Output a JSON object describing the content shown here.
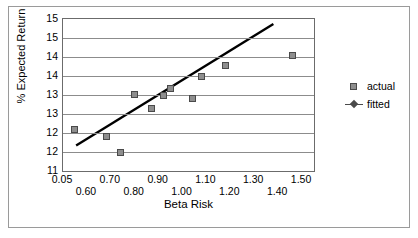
{
  "chart_data": {
    "type": "scatter",
    "title": "",
    "xlabel": "Beta Risk",
    "ylabel": "% Expected Return",
    "xlim": [
      0.5,
      1.55
    ],
    "ylim": [
      11.0,
      15.0
    ],
    "grid": "horizontal",
    "legend_position": "right",
    "x_tick_labels": [
      "0.05",
      "0.60",
      "0.70",
      "0.80",
      "0.90",
      "1.00",
      "1.10",
      "1.20",
      "1.30",
      "1.40",
      "1.50"
    ],
    "x_tick_values": [
      0.5,
      0.6,
      0.7,
      0.8,
      0.9,
      1.0,
      1.1,
      1.2,
      1.3,
      1.4,
      1.5
    ],
    "y_tick_labels": [
      "15",
      "15",
      "14",
      "14",
      "13",
      "13",
      "12",
      "12",
      "11"
    ],
    "y_tick_values": [
      15.0,
      14.5,
      14.0,
      13.5,
      13.0,
      12.5,
      12.0,
      11.5,
      11.0
    ],
    "series": [
      {
        "name": "actual",
        "type": "scatter",
        "marker": "square",
        "color": "#8e8e8e",
        "points": [
          {
            "x": 0.55,
            "y": 12.1
          },
          {
            "x": 0.68,
            "y": 11.9
          },
          {
            "x": 0.74,
            "y": 11.5
          },
          {
            "x": 0.8,
            "y": 13.02
          },
          {
            "x": 0.87,
            "y": 12.65
          },
          {
            "x": 0.92,
            "y": 12.98
          },
          {
            "x": 0.95,
            "y": 13.18
          },
          {
            "x": 1.04,
            "y": 12.92
          },
          {
            "x": 1.08,
            "y": 13.5
          },
          {
            "x": 1.18,
            "y": 13.78
          },
          {
            "x": 1.46,
            "y": 14.05
          }
        ]
      },
      {
        "name": "fitted",
        "type": "line",
        "marker": "diamond",
        "color": "#000000",
        "endpoints": [
          {
            "x": 0.555,
            "y": 11.67
          },
          {
            "x": 1.38,
            "y": 14.87
          }
        ]
      }
    ]
  },
  "legend": {
    "entries": [
      {
        "label": "actual",
        "key": "square-marker"
      },
      {
        "label": "fitted",
        "key": "line-diamond-marker"
      }
    ]
  }
}
